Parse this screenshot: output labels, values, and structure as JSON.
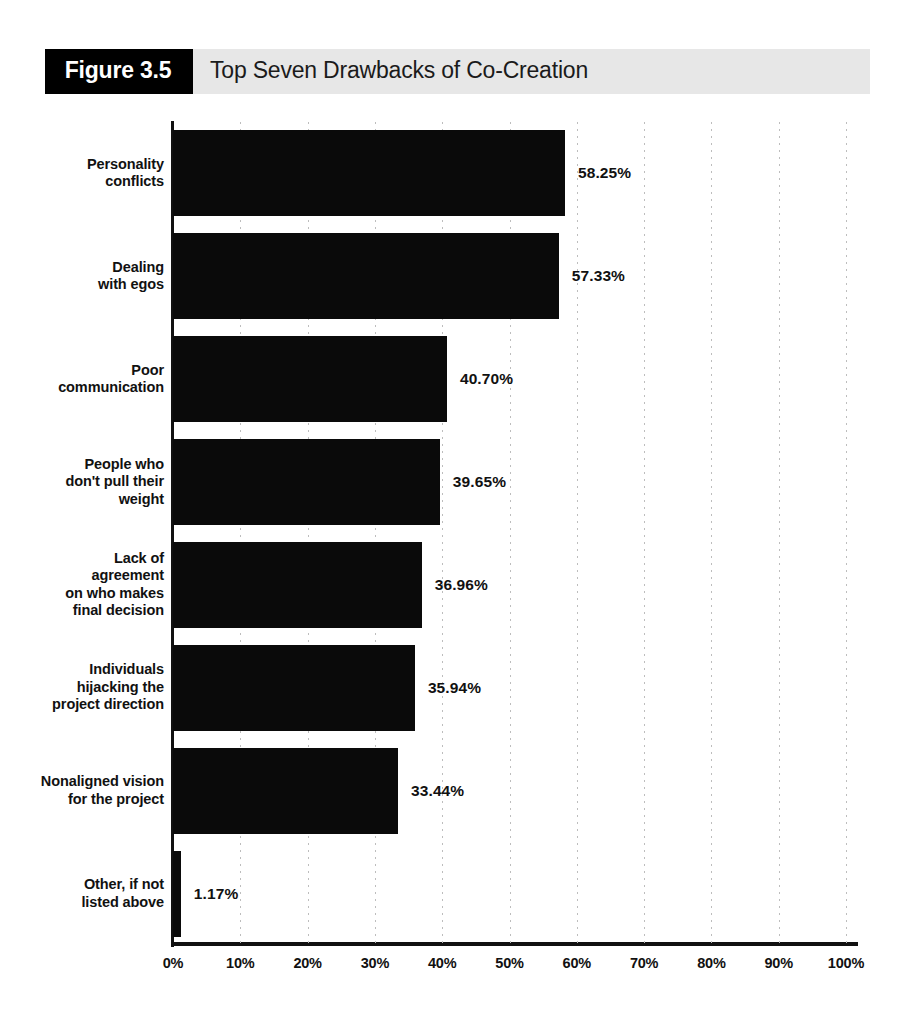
{
  "figure": {
    "badge_label": "Figure 3.5",
    "title": "Top Seven Drawbacks of Co-Creation"
  },
  "colors": {
    "bar": "#0a0a0a",
    "axis": "#111111",
    "header_band": "#e7e7e7",
    "badge_bg": "#000000",
    "badge_text": "#ffffff",
    "gridline": "#bdbdbd"
  },
  "chart_data": {
    "type": "bar",
    "orientation": "horizontal",
    "title": "Top Seven Drawbacks of Co-Creation",
    "xlabel": "",
    "ylabel": "",
    "xlim": [
      0,
      100
    ],
    "grid": "vertical-dotted",
    "legend": "none",
    "x_tick_labels": [
      "0%",
      "10%",
      "20%",
      "30%",
      "40%",
      "50%",
      "60%",
      "70%",
      "80%",
      "90%",
      "100%"
    ],
    "x_tick_values": [
      0,
      10,
      20,
      30,
      40,
      50,
      60,
      70,
      80,
      90,
      100
    ],
    "value_suffix": "%",
    "categories": [
      "Personality\nconflicts",
      "Dealing\nwith egos",
      "Poor\ncommunication",
      "People who\ndon't pull their\nweight",
      "Lack of agreement\non who makes\nfinal decision",
      "Individuals\nhijacking the\nproject direction",
      "Nonaligned vision\nfor the project",
      "Other, if not\nlisted above"
    ],
    "values": [
      58.25,
      57.33,
      40.7,
      39.65,
      36.96,
      35.94,
      33.44,
      1.17
    ],
    "data_labels": [
      "58.25%",
      "57.33%",
      "40.70%",
      "39.65%",
      "36.96%",
      "35.94%",
      "33.44%",
      "1.17%"
    ]
  }
}
